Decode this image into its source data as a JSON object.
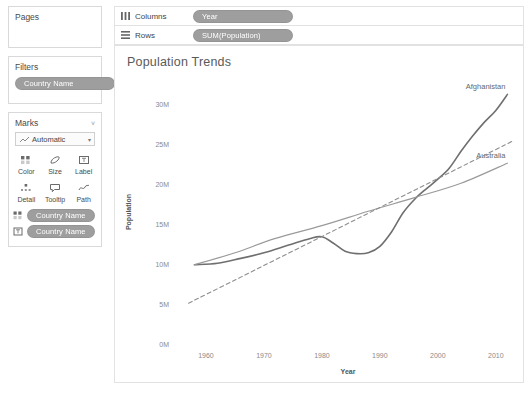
{
  "left_panel": {
    "pages": {
      "title": "Pages"
    },
    "filters": {
      "title": "Filters",
      "pills": [
        {
          "label": "Country Name"
        }
      ]
    },
    "marks": {
      "title": "Marks",
      "caret": "˅",
      "type_selector": {
        "value": "Automatic",
        "icon": "line-mark-icon",
        "arrow": "▾"
      },
      "buttons": [
        {
          "label": "Color",
          "icon": "color-icon"
        },
        {
          "label": "Size",
          "icon": "size-icon"
        },
        {
          "label": "Label",
          "icon": "label-icon"
        },
        {
          "label": "Detail",
          "icon": "detail-icon"
        },
        {
          "label": "Tooltip",
          "icon": "tooltip-icon"
        },
        {
          "label": "Path",
          "icon": "path-icon"
        }
      ],
      "pills": [
        {
          "label": "Country Name",
          "icon": "color-icon"
        },
        {
          "label": "Country Name",
          "icon": "label-icon"
        }
      ]
    }
  },
  "shelves": [
    {
      "name": "Columns",
      "icon": "columns-icon",
      "pill": "Year"
    },
    {
      "name": "Rows",
      "icon": "rows-icon",
      "pill": "SUM(Population)"
    }
  ],
  "viz": {
    "title": "Population Trends"
  },
  "chart_data": {
    "type": "line",
    "title": "Population Trends",
    "xlabel": "Year",
    "ylabel": "Population",
    "xlim": [
      1955,
      2014
    ],
    "ylim": [
      0,
      33000000
    ],
    "xticks": [
      1960,
      1970,
      1980,
      1990,
      2000,
      2010
    ],
    "xtick_labels": [
      "1960",
      "1970",
      "1980",
      "1990",
      "2000",
      "2010"
    ],
    "yticks": [
      0,
      5000000,
      10000000,
      15000000,
      20000000,
      25000000,
      30000000
    ],
    "ytick_labels": [
      "0M",
      "5M",
      "10M",
      "15M",
      "20M",
      "25M",
      "30M"
    ],
    "grid": false,
    "legend": "inline-series-labels",
    "colors": {
      "afghanistan": "#6f6f6f",
      "australia": "#9a9a9a",
      "third": "#8e8e8e"
    },
    "series": [
      {
        "name": "Afghanistan",
        "style": "solid",
        "color": "#6f6f6f",
        "width": 1.6,
        "label_position": "right-top",
        "x": [
          1958,
          1962,
          1966,
          1970,
          1974,
          1978,
          1980,
          1982,
          1984,
          1986,
          1988,
          1990,
          1992,
          1994,
          1996,
          1998,
          2000,
          2002,
          2004,
          2006,
          2008,
          2010,
          2012
        ],
        "y": [
          9900000,
          10100000,
          10700000,
          11400000,
          12300000,
          13200000,
          13400000,
          12600000,
          11600000,
          11300000,
          11400000,
          12200000,
          14000000,
          16400000,
          18100000,
          19400000,
          20600000,
          22000000,
          24100000,
          26000000,
          27700000,
          29200000,
          31200000
        ]
      },
      {
        "name": "Australia",
        "style": "solid",
        "color": "#9a9a9a",
        "width": 1.2,
        "label_position": "right-middle",
        "x": [
          1958,
          1965,
          1972,
          1980,
          1988,
          1996,
          2004,
          2012
        ],
        "y": [
          9900000,
          11400000,
          13200000,
          14800000,
          16600000,
          18300000,
          20100000,
          22600000
        ]
      },
      {
        "name": "",
        "style": "dashed",
        "color": "#8e8e8e",
        "width": 1.1,
        "label_position": "none",
        "x": [
          1957,
          1965,
          1973,
          1981,
          1989,
          1997,
          2005,
          2013
        ],
        "y": [
          5100000,
          8000000,
          10900000,
          13800000,
          16700000,
          19600000,
          22500000,
          25400000
        ]
      }
    ]
  }
}
